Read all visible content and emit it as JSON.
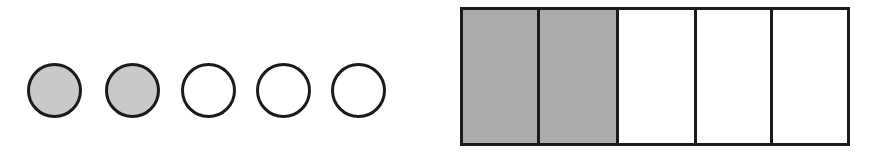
{
  "figure": {
    "width": 885,
    "height": 158,
    "background_color": "#ffffff",
    "outline_color": "#1b1b1b"
  },
  "circle_group": {
    "name": "circle-set",
    "label": "Row of five circles, two shaded",
    "total": 5,
    "shaded_count": 2,
    "unshaded_count": 3,
    "fraction_shaded": "2/5",
    "shaded_fill_color": "#c9c9c9",
    "unshaded_fill_color": "#ffffff",
    "outline_color": "#1b1b1b",
    "items": [
      {
        "index": 1,
        "state": "shaded",
        "left": 27,
        "top": 63,
        "size": 55
      },
      {
        "index": 2,
        "state": "shaded",
        "left": 105,
        "top": 63,
        "size": 55
      },
      {
        "index": 3,
        "state": "unshaded",
        "left": 181,
        "top": 63,
        "size": 55
      },
      {
        "index": 4,
        "state": "unshaded",
        "left": 256,
        "top": 63,
        "size": 55
      },
      {
        "index": 5,
        "state": "unshaded",
        "left": 331,
        "top": 63,
        "size": 55
      }
    ]
  },
  "bar_group": {
    "name": "fraction-bar",
    "label": "Rectangle partitioned into five equal parts, two shaded",
    "total": 5,
    "shaded_count": 2,
    "unshaded_count": 3,
    "fraction_shaded": "2/5",
    "shaded_fill_color": "#ababab",
    "unshaded_fill_color": "#ffffff",
    "outline_color": "#1b1b1b",
    "left": 460,
    "top": 7,
    "width": 390,
    "height": 139,
    "cells": [
      {
        "index": 1,
        "state": "shaded"
      },
      {
        "index": 2,
        "state": "shaded"
      },
      {
        "index": 3,
        "state": "unshaded"
      },
      {
        "index": 4,
        "state": "unshaded"
      },
      {
        "index": 5,
        "state": "unshaded"
      }
    ]
  }
}
